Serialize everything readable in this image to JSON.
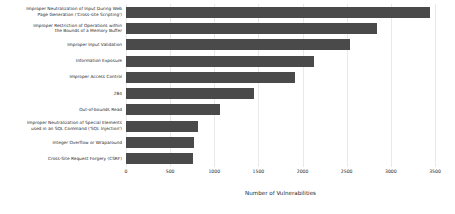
{
  "chart_data": {
    "type": "bar",
    "orientation": "horizontal",
    "title": "",
    "xlabel": "Number of Vulnerabilities",
    "ylabel": "",
    "xlim": [
      0,
      3500
    ],
    "ylim": null,
    "grid": true,
    "legend": false,
    "bar_color": "#4a4a4a",
    "background_color": "#ffffff",
    "xticks": [
      0,
      500,
      1000,
      1500,
      2000,
      2500,
      3000,
      3500
    ],
    "xticklabels": [
      "0",
      "500",
      "1000",
      "1500",
      "2000",
      "2500",
      "3000",
      "3500"
    ],
    "categories": [
      "Improper Neutralization of Input During Web\nPage Generation ('Cross-site Scripting')",
      "Improper Restriction of Operations within\nthe Bounds of a Memory Buffer",
      "Improper Input Validation",
      "Information Exposure",
      "Improper Access Control",
      "284",
      "Out-of-bounds Read",
      "Improper Neutralization of Special Elements\nused in an SQL Command ('SQL Injection')",
      "Integer Overflow or Wraparound",
      "Cross-Site Request Forgery (CSRF)"
    ],
    "values": [
      3440,
      2840,
      2535,
      2125,
      1910,
      1445,
      1070,
      815,
      775,
      760
    ]
  }
}
